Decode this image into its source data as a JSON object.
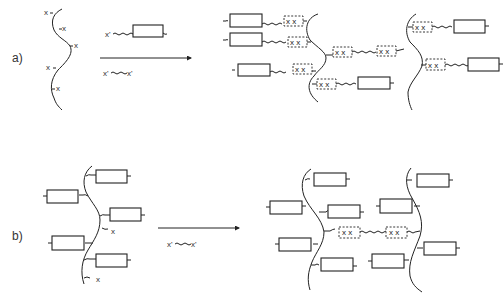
{
  "panels": {
    "a": {
      "label": "a)",
      "backbone_site": "x",
      "reagent_1": "x'",
      "reagent_2_left": "x'",
      "reagent_2_right": "x'",
      "crosslink": "x x"
    },
    "b": {
      "label": "b)",
      "site": "x",
      "reagent_left": "x'",
      "reagent_right": "x'",
      "crosslink": "x x"
    }
  },
  "colors": {
    "line": "#222222",
    "background": "#ffffff"
  }
}
